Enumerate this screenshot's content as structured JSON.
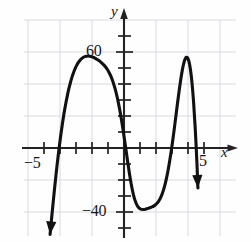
{
  "figure": {
    "name": "quartic-polynomial-graph",
    "background": "#fefefe"
  },
  "labels": {
    "y_axis": "y",
    "x_axis": "x",
    "y_tick_60": "60",
    "y_tick_minus40": "−40",
    "x_tick_minus5": "−5",
    "x_tick_5": "5"
  },
  "colors": {
    "curve": "#111111",
    "axis": "#2a2a2a",
    "grid": "#c8c9d4",
    "text": "#161616",
    "background": "#fefefe"
  },
  "chart_data": {
    "type": "line",
    "title": "",
    "xlabel": "x",
    "ylabel": "y",
    "xlim": [
      -6.2,
      6.5
    ],
    "ylim": [
      -58,
      88
    ],
    "grid": true,
    "legend": null,
    "x_ticks": [
      -5,
      5
    ],
    "x_tick_labels": [
      "−5",
      "5"
    ],
    "y_ticks": [
      60,
      -40
    ],
    "y_tick_labels": [
      "60",
      "−40"
    ],
    "x_tick_step": 1,
    "y_tick_step": 10,
    "grid_step_x": 2,
    "grid_step_y": 20,
    "features": {
      "local_minimum": {
        "x": 0,
        "y": 0
      },
      "local_maxima": [
        {
          "x": -3,
          "y": 65
        },
        {
          "x": 3,
          "y": 65
        }
      ],
      "roots": [
        -4.3,
        0,
        4.3
      ],
      "end_behavior": "down-left, down-right",
      "arrow_tips": [
        {
          "x": -4.5,
          "y": -53
        },
        {
          "x": 4.4,
          "y": -53
        }
      ]
    },
    "series": [
      {
        "name": "f(x)",
        "x": [
          -4.62,
          -4.55,
          -4.45,
          -4.35,
          -4.25,
          -4.15,
          -4.05,
          -3.95,
          -3.85,
          -3.75,
          -3.65,
          -3.55,
          -3.45,
          -3.35,
          -3.25,
          -3.15,
          -3.05,
          -2.95,
          -2.85,
          -2.75,
          -2.65,
          -2.55,
          -2.45,
          -2.35,
          -2.25,
          -2.15,
          -2.05,
          -1.95,
          -1.85,
          -1.75,
          -1.65,
          -1.55,
          -1.45,
          -1.35,
          -1.25,
          -1.15,
          -1.05,
          -0.95,
          -0.85,
          -0.75,
          -0.65,
          -0.55,
          -0.45,
          -0.35,
          -0.25,
          -0.15,
          -0.05,
          0.05,
          0.15,
          0.25,
          0.35,
          0.45,
          0.55,
          0.65,
          0.75,
          0.85,
          0.95,
          1.05,
          1.15,
          1.25,
          1.35,
          1.45,
          1.55,
          1.65,
          1.75,
          1.85,
          1.95,
          2.05,
          2.15,
          2.25,
          2.35,
          2.45,
          2.55,
          2.65,
          2.75,
          2.85,
          2.95,
          3.05,
          3.15,
          3.25,
          3.35,
          3.45,
          3.55,
          3.65,
          3.75,
          3.85,
          3.95,
          4.05,
          4.15,
          4.25,
          4.35,
          4.45,
          4.55,
          4.62
        ],
        "y": [
          -54.0,
          -46.6,
          -36.3,
          -26.3,
          -16.8,
          -7.9,
          0.4,
          8.1,
          15.1,
          21.5,
          27.2,
          32.3,
          36.9,
          40.8,
          44.3,
          47.2,
          49.7,
          51.8,
          53.5,
          54.8,
          55.9,
          56.6,
          57.1,
          57.4,
          57.5,
          57.4,
          57.2,
          56.8,
          56.4,
          55.8,
          55.2,
          54.5,
          53.7,
          52.8,
          51.8,
          50.6,
          49.2,
          47.5,
          45.5,
          43.1,
          40.2,
          36.8,
          32.8,
          28.2,
          23.0,
          17.2,
          10.8,
          4.0,
          -3.0,
          -10.0,
          -16.6,
          -22.5,
          -27.5,
          -31.5,
          -34.4,
          -36.4,
          -37.6,
          -38.2,
          -38.4,
          -38.4,
          -38.2,
          -37.9,
          -37.6,
          -37.2,
          -36.8,
          -36.3,
          -35.6,
          -34.7,
          -33.5,
          -31.8,
          -29.6,
          -26.8,
          -23.3,
          -19.1,
          -14.2,
          -8.5,
          -2.1,
          5.0,
          12.6,
          20.5,
          28.4,
          36.0,
          43.0,
          49.0,
          53.5,
          56.2,
          56.6,
          54.4,
          49.2,
          40.7,
          28.6,
          12.5,
          -7.7,
          -25.0
        ]
      }
    ]
  }
}
